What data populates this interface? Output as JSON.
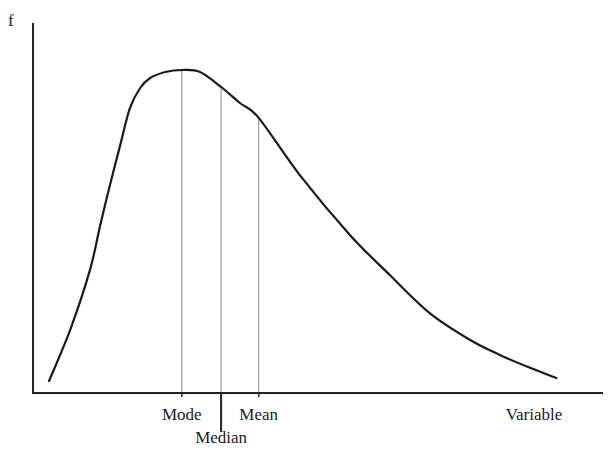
{
  "chart_data": {
    "type": "line",
    "title": "",
    "ylabel": "f",
    "xlabel": "Variable",
    "xlim": [
      0,
      100
    ],
    "ylim": [
      0,
      1
    ],
    "grid": false,
    "legend": "none",
    "series": [
      {
        "name": "density",
        "x": [
          2.8,
          6.5,
          10.0,
          11.8,
          13.5,
          15.3,
          17.0,
          18.8,
          20.5,
          23.2,
          26.1,
          29.3,
          33.0,
          36.3,
          39.6,
          46.8,
          55.6,
          62.6,
          69.6,
          76.7,
          81.9,
          87.2,
          91.8
        ],
        "y": [
          0.035,
          0.185,
          0.362,
          0.494,
          0.612,
          0.729,
          0.838,
          0.897,
          0.926,
          0.944,
          0.95,
          0.944,
          0.9,
          0.853,
          0.809,
          0.641,
          0.465,
          0.347,
          0.235,
          0.156,
          0.112,
          0.074,
          0.044
        ]
      }
    ],
    "markers": [
      {
        "name": "Mode",
        "x": 26.1,
        "f": 0.95,
        "extends_below": "short"
      },
      {
        "name": "Median",
        "x": 33.0,
        "f": 0.9,
        "extends_below": "long"
      },
      {
        "name": "Mean",
        "x": 39.6,
        "f": 0.809,
        "extends_below": "short"
      }
    ],
    "annotations": [
      "Mode",
      "Median",
      "Mean"
    ]
  }
}
